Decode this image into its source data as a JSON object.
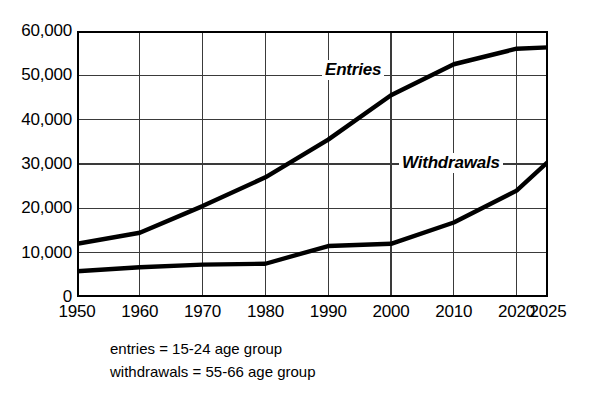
{
  "chart_data": {
    "type": "line",
    "title": "",
    "xlabel": "",
    "ylabel": "",
    "x": [
      1950,
      1960,
      1970,
      1980,
      1990,
      2000,
      2010,
      2020,
      2025
    ],
    "xlim": [
      1950,
      2025
    ],
    "ylim": [
      0,
      60000
    ],
    "grid": true,
    "legend_position": "inline-annotations",
    "x_tick_labels": [
      "1950",
      "1960",
      "1970",
      "1980",
      "1990",
      "2000",
      "2010",
      "2020",
      "2025"
    ],
    "y_tick_labels": [
      "0",
      "10,000",
      "20,000",
      "30,000",
      "40,000",
      "50,000",
      "60,000"
    ],
    "y_ticks": [
      0,
      10000,
      20000,
      30000,
      40000,
      50000,
      60000
    ],
    "series": [
      {
        "name": "Entries",
        "label": "Entries",
        "color": "#000000",
        "values": [
          12000,
          14500,
          20500,
          27000,
          35500,
          45500,
          52500,
          56000,
          56300
        ]
      },
      {
        "name": "Withdrawals",
        "label": "Withdrawals",
        "color": "#000000",
        "values": [
          5800,
          6700,
          7300,
          7500,
          11500,
          12000,
          16800,
          24000,
          30500
        ]
      }
    ],
    "annotations": [
      {
        "text": "Entries",
        "x": 1990,
        "y": 48500
      },
      {
        "text": "Withdrawals",
        "x": 2005,
        "y": 28500
      }
    ]
  },
  "legend_notes": [
    "entries = 15-24 age group",
    "withdrawals = 55-66 age group"
  ],
  "colors": {
    "line": "#000000",
    "grid": "#3a3a3a",
    "axis": "#000000",
    "background": "#ffffff"
  }
}
